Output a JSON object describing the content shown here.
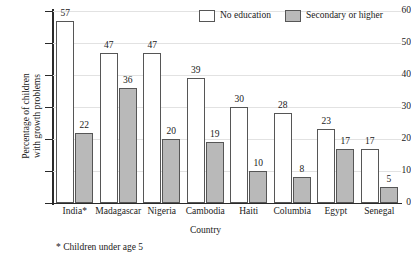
{
  "chart_data": {
    "type": "bar",
    "title": "",
    "xlabel": "Country",
    "ylabel_line1": "Percentage of children",
    "ylabel_line2": "with growth problems",
    "ylim": [
      0,
      60
    ],
    "yticks": [
      0,
      10,
      20,
      30,
      40,
      50,
      60
    ],
    "grid": true,
    "legend_position": "top-right",
    "categories": [
      "India*",
      "Madagascar",
      "Nigeria",
      "Cambodia",
      "Haiti",
      "Columbia",
      "Egypt",
      "Senegal"
    ],
    "series": [
      {
        "name": "No education",
        "color": "#ffffff",
        "values": [
          57,
          47,
          47,
          39,
          30,
          28,
          23,
          17
        ]
      },
      {
        "name": "Secondary or higher",
        "color": "#b9b9b9",
        "values": [
          22,
          36,
          20,
          19,
          10,
          8,
          17,
          5
        ]
      }
    ],
    "footnote": "* Children under age 5"
  },
  "legend": {
    "items": [
      {
        "label": "No education",
        "swatch": "no-edu"
      },
      {
        "label": "Secondary or higher",
        "swatch": "sec"
      }
    ]
  }
}
